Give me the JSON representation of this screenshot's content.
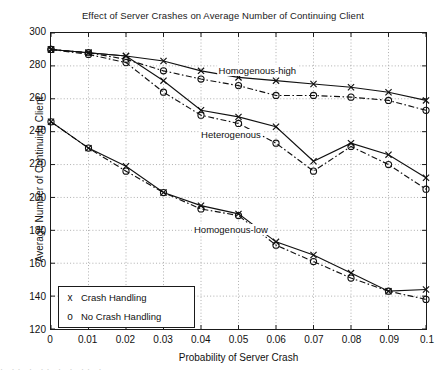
{
  "chart_data": {
    "type": "line",
    "title": "Effect of Server Crashes on Average Number of Continuing Client",
    "xlabel": "Probability of Server Crash",
    "ylabel": "Average Number of Continuing Client",
    "xlim": [
      0,
      0.1
    ],
    "ylim": [
      120,
      300
    ],
    "xticks": [
      "0",
      "0.01",
      "0.02",
      "0.03",
      "0.04",
      "0.05",
      "0.06",
      "0.07",
      "0.08",
      "0.09",
      "0.1"
    ],
    "xtick_values": [
      0,
      0.01,
      0.02,
      0.03,
      0.04,
      0.05,
      0.06,
      0.07,
      0.08,
      0.09,
      0.1
    ],
    "yticks": [
      "120",
      "140",
      "160",
      "180",
      "200",
      "220",
      "240",
      "260",
      "280",
      "300"
    ],
    "ytick_values": [
      120,
      140,
      160,
      180,
      200,
      220,
      240,
      260,
      280,
      300
    ],
    "grid": true,
    "grid_style": "dotted",
    "legend_position": "lower left",
    "x": [
      0,
      0.01,
      0.02,
      0.03,
      0.04,
      0.05,
      0.06,
      0.07,
      0.08,
      0.09,
      0.1
    ],
    "series": [
      {
        "name": "Homogenous-high / Crash Handling",
        "group": "Homogenous-high",
        "legend": "Crash Handling",
        "marker": "x",
        "line": "solid",
        "values": [
          290,
          288,
          286,
          283,
          277,
          273,
          271,
          269,
          267,
          264,
          259
        ]
      },
      {
        "name": "Homogenous-high / No Crash Handling",
        "group": "Homogenous-high",
        "legend": "No Crash Handling",
        "marker": "o",
        "line": "dash-dot",
        "values": [
          290,
          288,
          284,
          277,
          272,
          268,
          262,
          262,
          261,
          259,
          253
        ]
      },
      {
        "name": "Heterogenous / Crash Handling",
        "group": "Heterogenous",
        "legend": "Crash Handling",
        "marker": "x",
        "line": "solid",
        "values": [
          290,
          288,
          286,
          271,
          253,
          249,
          243,
          222,
          233,
          226,
          212
        ]
      },
      {
        "name": "Heterogenous / No Crash Handling",
        "group": "Heterogenous",
        "legend": "No Crash Handling",
        "marker": "o",
        "line": "dash-dot",
        "values": [
          290,
          287,
          282,
          264,
          250,
          245,
          233,
          216,
          231,
          220,
          205
        ]
      },
      {
        "name": "Homogenous-low / Crash Handling",
        "group": "Homogenous-low",
        "legend": "Crash Handling",
        "marker": "x",
        "line": "solid",
        "values": [
          246,
          230,
          219,
          203,
          195,
          190,
          173,
          165,
          154,
          143,
          144
        ]
      },
      {
        "name": "Homogenous-low / No Crash Handling",
        "group": "Homogenous-low",
        "legend": "No Crash Handling",
        "marker": "o",
        "line": "dash-dot",
        "values": [
          246,
          230,
          216,
          203,
          193,
          189,
          171,
          161,
          151,
          143,
          138
        ]
      }
    ],
    "annotations": [
      {
        "text": "Homogenous-high",
        "x": 0.055,
        "y": 276
      },
      {
        "text": "Heterogenous",
        "x": 0.048,
        "y": 237
      },
      {
        "text": "Homogenous-low",
        "x": 0.048,
        "y": 180
      }
    ],
    "legend_entries": [
      {
        "marker": "x",
        "label": "Crash Handling"
      },
      {
        "marker": "o",
        "label": "No Crash Handling"
      }
    ],
    "colors": {
      "line": "#111111",
      "grid": "#9a9a9a",
      "axis": "#1a1a1a",
      "background": "#ffffff"
    }
  },
  "scan": {
    "artifact_text": "·  ··  ·    ·· ·  ·   ··  ·"
  }
}
